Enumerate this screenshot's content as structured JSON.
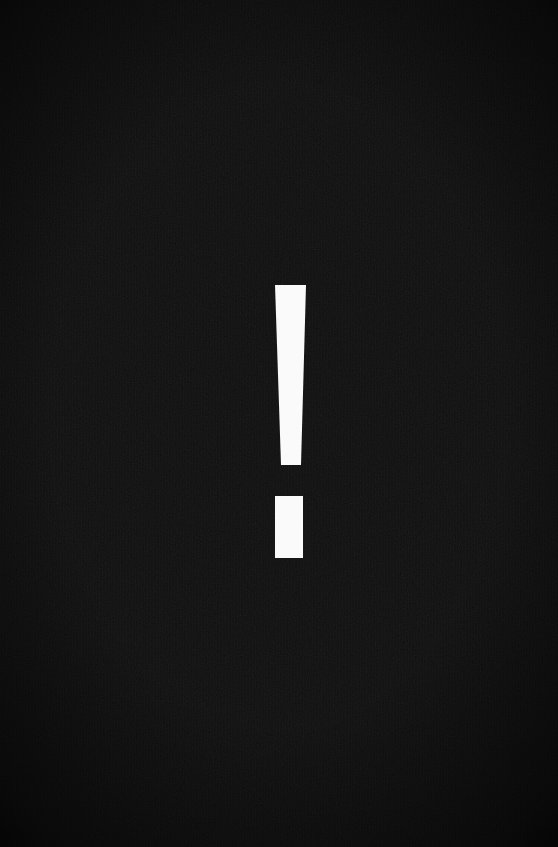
{
  "canvas": {
    "width": 558,
    "height": 847,
    "background_color": "#0d0d0d",
    "background_style": "flat near-black field with fine grain texture and edge vignette"
  },
  "symbol": {
    "name": "exclamation-mark",
    "character": "!",
    "meaning": "warning",
    "color": "#fafafa",
    "stem": {
      "top_y": 285,
      "bottom_y": 465,
      "top_left_x": 275,
      "top_right_x": 306,
      "bottom_left_x": 281,
      "bottom_right_x": 301
    },
    "dot": {
      "left_x": 275,
      "right_x": 303,
      "top_y": 496,
      "bottom_y": 558
    }
  }
}
